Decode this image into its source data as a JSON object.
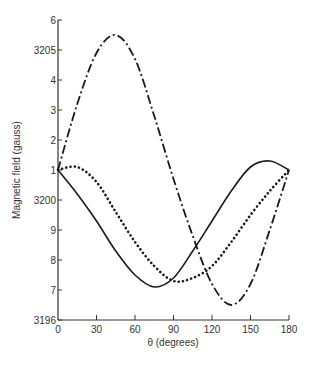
{
  "chart_data": {
    "type": "line",
    "title": "",
    "xlabel": "θ (degrees)",
    "ylabel": "Magnetic field (gauss)",
    "xlim": [
      0,
      180
    ],
    "ylim": [
      3196,
      3206
    ],
    "grid": false,
    "legend": null,
    "x_ticks": [
      {
        "value": 0,
        "label": "0"
      },
      {
        "value": 30,
        "label": "30"
      },
      {
        "value": 60,
        "label": "60"
      },
      {
        "value": 90,
        "label": "90"
      },
      {
        "value": 120,
        "label": "120"
      },
      {
        "value": 150,
        "label": "150"
      },
      {
        "value": 180,
        "label": "180"
      }
    ],
    "y_ticks": [
      {
        "value": 3196,
        "label": "3196"
      },
      {
        "value": 3197,
        "label": "7"
      },
      {
        "value": 3198,
        "label": "8"
      },
      {
        "value": 3199,
        "label": "9"
      },
      {
        "value": 3200,
        "label": "3200"
      },
      {
        "value": 3201,
        "label": "1"
      },
      {
        "value": 3202,
        "label": "2"
      },
      {
        "value": 3203,
        "label": "3"
      },
      {
        "value": 3204,
        "label": "4"
      },
      {
        "value": 3205,
        "label": "3205"
      },
      {
        "value": 3206,
        "label": "6"
      }
    ],
    "x": [
      0,
      15,
      30,
      45,
      60,
      75,
      90,
      105,
      120,
      135,
      150,
      165,
      180
    ],
    "series": [
      {
        "name": "solid",
        "style": "solid",
        "values": [
          3201,
          3200.2,
          3199.3,
          3198.3,
          3197.5,
          3197.1,
          3197.4,
          3198.3,
          3199.3,
          3200.3,
          3201.1,
          3201.3,
          3201
        ]
      },
      {
        "name": "dotted",
        "style": "dotted",
        "values": [
          3201,
          3201.1,
          3200.6,
          3199.6,
          3198.6,
          3197.8,
          3197.3,
          3197.4,
          3197.8,
          3198.6,
          3199.5,
          3200.3,
          3201
        ]
      },
      {
        "name": "dash-dot",
        "style": "dash-dot",
        "values": [
          3201,
          3203.2,
          3204.9,
          3205.5,
          3204.7,
          3202.8,
          3200.7,
          3198.8,
          3197.2,
          3196.5,
          3197.2,
          3199.0,
          3201
        ]
      }
    ]
  },
  "colors": {
    "line": "#1a1a1a",
    "axis": "#333333"
  }
}
